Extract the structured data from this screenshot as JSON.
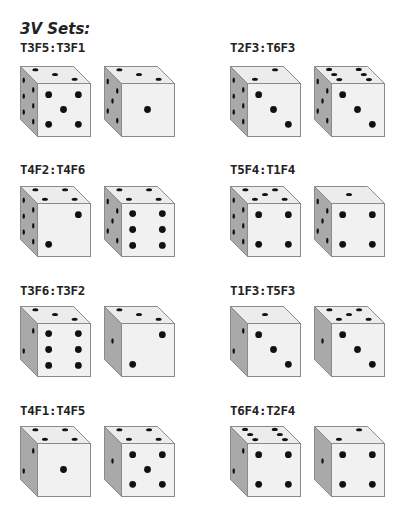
{
  "heading": "3V Sets:",
  "colors": {
    "top_face": "#ececec",
    "front_face": "#f1f1f1",
    "side_face": "#a9a9a9",
    "edge": "#8a8a8a",
    "pip": "#111111"
  },
  "sets": [
    {
      "label": "T3F5:T3F1",
      "dice": [
        {
          "top": 3,
          "front": 5,
          "side": 6
        },
        {
          "top": 3,
          "front": 1,
          "side": 5
        }
      ]
    },
    {
      "label": "T2F3:T6F3",
      "dice": [
        {
          "top": 2,
          "front": 3,
          "side": 6
        },
        {
          "top": 6,
          "front": 3,
          "side": 5
        }
      ]
    },
    {
      "label": "T4F2:T4F6",
      "dice": [
        {
          "top": 4,
          "front": 2,
          "side": 6
        },
        {
          "top": 4,
          "front": 6,
          "side": 5
        }
      ]
    },
    {
      "label": "T5F4:T1F4",
      "dice": [
        {
          "top": 5,
          "front": 4,
          "side": 6
        },
        {
          "top": 1,
          "front": 4,
          "side": 5
        }
      ]
    },
    {
      "label": "T3F6:T3F2",
      "dice": [
        {
          "top": 3,
          "front": 6,
          "side": 2
        },
        {
          "top": 3,
          "front": 2,
          "side": 1
        }
      ]
    },
    {
      "label": "T1F3:T5F3",
      "dice": [
        {
          "top": 1,
          "front": 3,
          "side": 2
        },
        {
          "top": 5,
          "front": 3,
          "side": 1
        }
      ]
    },
    {
      "label": "T4F1:T4F5",
      "dice": [
        {
          "top": 4,
          "front": 1,
          "side": 2
        },
        {
          "top": 4,
          "front": 5,
          "side": 1
        }
      ]
    },
    {
      "label": "T6F4:T2F4",
      "dice": [
        {
          "top": 6,
          "front": 4,
          "side": 2
        },
        {
          "top": 2,
          "front": 4,
          "side": 1
        }
      ]
    }
  ]
}
